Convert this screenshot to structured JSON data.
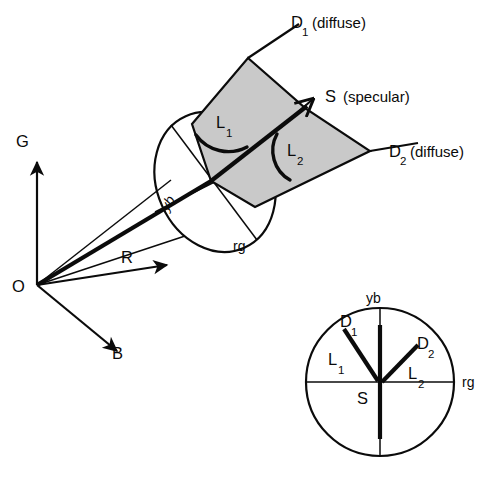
{
  "figure": {
    "background_color": "#ffffff",
    "ink_color": "#0b0b0b",
    "plane_fill_color": "#c9c9c9"
  },
  "axes": {
    "origin_label": "O",
    "g_label": "G",
    "r_label": "R",
    "b_label": "B"
  },
  "main": {
    "d1_label": "D",
    "d1_subscript": "1",
    "d1_note": "(diffuse)",
    "d2_label": "D",
    "d2_subscript": "2",
    "d2_note": "(diffuse)",
    "s_label": "S",
    "s_note": "(specular)",
    "l1_label": "L",
    "l1_subscript": "1",
    "l2_label": "L",
    "l2_subscript": "2",
    "yb_label": "yb",
    "rg_label": "rg"
  },
  "inset": {
    "yb_label": "yb",
    "rg_label": "rg",
    "s_label": "S",
    "d1_label": "D",
    "d1_subscript": "1",
    "d2_label": "D",
    "d2_subscript": "2",
    "l1_label": "L",
    "l1_subscript": "1",
    "l2_label": "L",
    "l2_subscript": "2"
  }
}
